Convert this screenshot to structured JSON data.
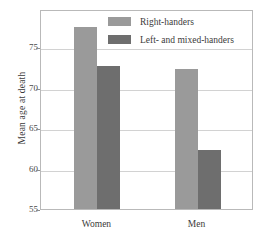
{
  "chart_data": {
    "type": "bar",
    "title": "",
    "xlabel": "",
    "ylabel": "Mean age at death",
    "categories": [
      "Women",
      "Men"
    ],
    "series": [
      {
        "name": "Right-handers",
        "values": [
          77.5,
          72.3
        ],
        "color": "#9a9a9a"
      },
      {
        "name": "Left- and mixed-handers",
        "values": [
          72.7,
          62.3
        ],
        "color": "#6e6e6e"
      }
    ],
    "ylim": [
      55,
      79.7
    ],
    "yticks": [
      55,
      60,
      65,
      70,
      75
    ],
    "ytick_labels": [
      "55",
      "60",
      "65",
      "70",
      "75"
    ],
    "grid": true,
    "legend_position": "top-center"
  },
  "legend": {
    "items": [
      {
        "label": "Right-handers"
      },
      {
        "label": "Left- and mixed-handers"
      }
    ]
  },
  "axes": {
    "y_title": "Mean age at death"
  }
}
